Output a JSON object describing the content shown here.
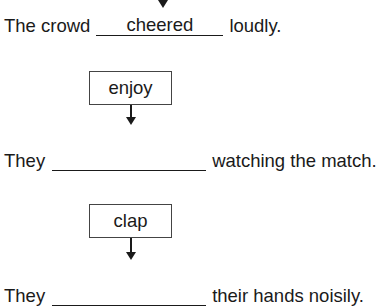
{
  "worksheet": {
    "items": [
      {
        "prompt_word": "",
        "before": "The crowd",
        "answer": "cheered",
        "after": "loudly."
      },
      {
        "prompt_word": "enjoy",
        "before": "They",
        "answer": "",
        "after": "watching the match."
      },
      {
        "prompt_word": "clap",
        "before": "They",
        "answer": "",
        "after": "their hands noisily."
      }
    ]
  }
}
